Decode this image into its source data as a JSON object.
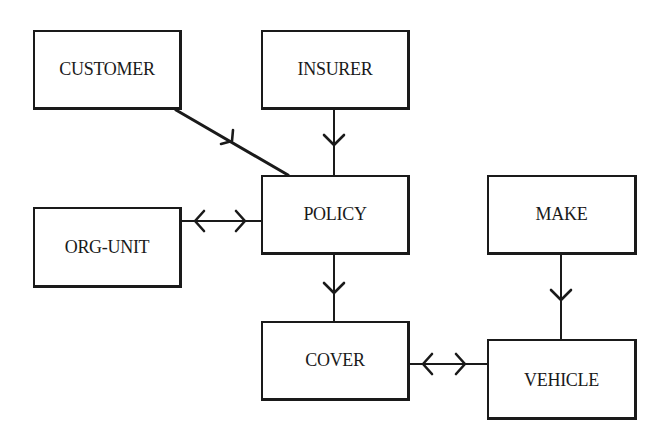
{
  "diagram": {
    "type": "entity-relationship",
    "entities": [
      {
        "id": "customer",
        "label": "CUSTOMER"
      },
      {
        "id": "insurer",
        "label": "INSURER"
      },
      {
        "id": "policy",
        "label": "POLICY"
      },
      {
        "id": "org_unit",
        "label": "ORG-UNIT"
      },
      {
        "id": "make",
        "label": "MAKE"
      },
      {
        "id": "cover",
        "label": "COVER"
      },
      {
        "id": "vehicle",
        "label": "VEHICLE"
      }
    ],
    "relationships": [
      {
        "from": "CUSTOMER",
        "to": "POLICY",
        "cardinality": "one-to-many"
      },
      {
        "from": "INSURER",
        "to": "POLICY",
        "cardinality": "one-to-many"
      },
      {
        "from": "POLICY",
        "to": "COVER",
        "cardinality": "one-to-many"
      },
      {
        "from": "ORG-UNIT",
        "to": "POLICY",
        "cardinality": "many-to-many"
      },
      {
        "from": "MAKE",
        "to": "VEHICLE",
        "cardinality": "one-to-many"
      },
      {
        "from": "COVER",
        "to": "VEHICLE",
        "cardinality": "many-to-many"
      }
    ],
    "colors": {
      "line": "#1a1a1a",
      "background": "#ffffff"
    }
  }
}
